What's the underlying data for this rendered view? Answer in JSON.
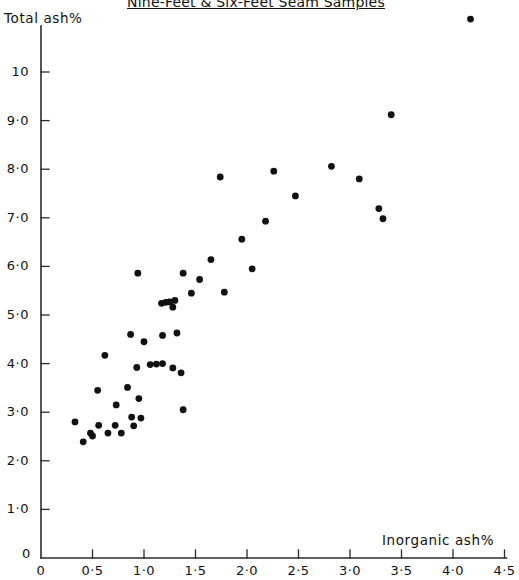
{
  "chart_data": {
    "type": "scatter",
    "title": "Nine-Feet & Six-Feet Seam Samples",
    "xlabel": "Inorganic ash%",
    "ylabel": "Total ash%",
    "xlim": [
      0,
      4.5
    ],
    "ylim": [
      0,
      11.5
    ],
    "grid": false,
    "legend": null,
    "xticks": [
      "0",
      "0·5",
      "1·0",
      "1·5",
      "2·0",
      "2·5",
      "3·0",
      "3·5",
      "4·0",
      "4·5"
    ],
    "xtickvalues": [
      0,
      0.5,
      1.0,
      1.5,
      2.0,
      2.5,
      3.0,
      3.5,
      4.0,
      4.5
    ],
    "yticks": [
      "0",
      "1·0",
      "2·0",
      "3·0",
      "4·0",
      "5·0",
      "6·0",
      "7·0",
      "8·0",
      "9·0",
      "10"
    ],
    "ytickvalues": [
      0,
      1,
      2,
      3,
      4,
      5,
      6,
      7,
      8,
      9,
      10
    ],
    "marker": {
      "shape": "circle",
      "color": "#111111",
      "size": 3.4
    },
    "points": [
      {
        "x": 0.33,
        "y": 2.8
      },
      {
        "x": 0.41,
        "y": 2.39
      },
      {
        "x": 0.48,
        "y": 2.57
      },
      {
        "x": 0.5,
        "y": 2.51
      },
      {
        "x": 0.55,
        "y": 3.45
      },
      {
        "x": 0.56,
        "y": 2.73
      },
      {
        "x": 0.62,
        "y": 4.17
      },
      {
        "x": 0.65,
        "y": 2.57
      },
      {
        "x": 0.72,
        "y": 2.73
      },
      {
        "x": 0.73,
        "y": 3.15
      },
      {
        "x": 0.78,
        "y": 2.57
      },
      {
        "x": 0.84,
        "y": 3.51
      },
      {
        "x": 0.87,
        "y": 4.6
      },
      {
        "x": 0.88,
        "y": 2.9
      },
      {
        "x": 0.9,
        "y": 2.72
      },
      {
        "x": 0.93,
        "y": 3.92
      },
      {
        "x": 0.94,
        "y": 5.86
      },
      {
        "x": 0.95,
        "y": 3.28
      },
      {
        "x": 0.97,
        "y": 2.88
      },
      {
        "x": 1.0,
        "y": 4.45
      },
      {
        "x": 1.06,
        "y": 3.98
      },
      {
        "x": 1.12,
        "y": 3.99
      },
      {
        "x": 1.17,
        "y": 5.24
      },
      {
        "x": 1.18,
        "y": 4.0
      },
      {
        "x": 1.18,
        "y": 4.58
      },
      {
        "x": 1.21,
        "y": 5.26
      },
      {
        "x": 1.25,
        "y": 5.27
      },
      {
        "x": 1.28,
        "y": 5.16
      },
      {
        "x": 1.28,
        "y": 3.91
      },
      {
        "x": 1.3,
        "y": 5.3
      },
      {
        "x": 1.32,
        "y": 4.63
      },
      {
        "x": 1.36,
        "y": 3.81
      },
      {
        "x": 1.38,
        "y": 3.05
      },
      {
        "x": 1.38,
        "y": 5.86
      },
      {
        "x": 1.46,
        "y": 5.45
      },
      {
        "x": 1.54,
        "y": 5.73
      },
      {
        "x": 1.65,
        "y": 6.14
      },
      {
        "x": 1.74,
        "y": 7.84
      },
      {
        "x": 1.78,
        "y": 5.47
      },
      {
        "x": 1.95,
        "y": 6.56
      },
      {
        "x": 2.05,
        "y": 5.95
      },
      {
        "x": 2.18,
        "y": 6.93
      },
      {
        "x": 2.26,
        "y": 7.96
      },
      {
        "x": 2.47,
        "y": 7.45
      },
      {
        "x": 2.82,
        "y": 8.06
      },
      {
        "x": 3.09,
        "y": 7.8
      },
      {
        "x": 3.4,
        "y": 9.12
      },
      {
        "x": 3.28,
        "y": 7.19
      },
      {
        "x": 3.32,
        "y": 6.98
      },
      {
        "x": 4.17,
        "y": 11.09
      }
    ]
  },
  "axes": {
    "origin_zero_x": "0",
    "origin_zero_y": "0"
  }
}
